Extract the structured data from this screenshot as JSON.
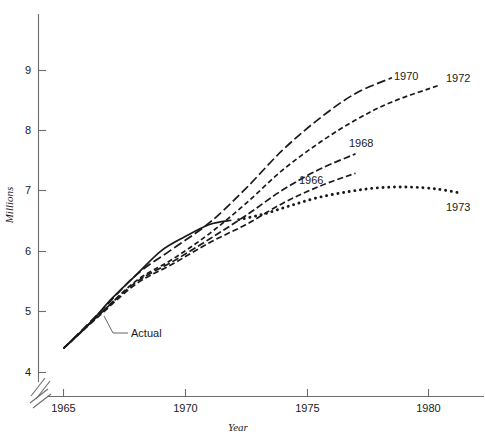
{
  "chart_data": {
    "type": "line",
    "title": "",
    "xlabel": "Year",
    "ylabel": "Millions",
    "xlim": [
      1964.2,
      1981.6
    ],
    "ylim": [
      3.85,
      9.55
    ],
    "grid": false,
    "legend_position": "inline-right-of-curve-ends",
    "axis_break": {
      "x": true,
      "y": true,
      "note": "double slash break near origin on both axes"
    },
    "xticks": [
      1965,
      1970,
      1975,
      1980
    ],
    "xtick_labels": [
      "1965",
      "1970",
      "1975",
      "1980"
    ],
    "yticks": [
      4,
      5,
      6,
      7,
      8,
      9
    ],
    "ytick_labels": [
      "4",
      "5",
      "6",
      "7",
      "8",
      "9"
    ],
    "series": [
      {
        "name": "Actual",
        "label": "Actual",
        "style": "solid",
        "x": [
          1965.0,
          1966.0,
          1967.0,
          1968.0,
          1969.0,
          1970.0,
          1971.0,
          1971.9
        ],
        "y": [
          4.4,
          4.78,
          5.23,
          5.62,
          6.01,
          6.25,
          6.45,
          6.52
        ]
      },
      {
        "name": "1966",
        "label": "1966",
        "style": "dashed",
        "x": [
          1965.0,
          1966.5,
          1968.0,
          1969.5,
          1971.0,
          1972.5,
          1974.0,
          1975.5,
          1977.0
        ],
        "y": [
          4.4,
          4.95,
          5.47,
          5.8,
          6.15,
          6.45,
          6.8,
          7.08,
          7.3
        ]
      },
      {
        "name": "1968",
        "label": "1968",
        "style": "dashed",
        "x": [
          1965.0,
          1966.5,
          1968.0,
          1969.5,
          1971.0,
          1972.5,
          1974.0,
          1975.5,
          1977.0
        ],
        "y": [
          4.4,
          4.97,
          5.5,
          5.84,
          6.21,
          6.6,
          7.02,
          7.36,
          7.62
        ]
      },
      {
        "name": "1970",
        "label": "1970",
        "style": "dashed",
        "x": [
          1965.0,
          1966.5,
          1968.0,
          1969.5,
          1971.0,
          1972.5,
          1974.0,
          1975.5,
          1977.0,
          1978.5
        ],
        "y": [
          4.4,
          5.0,
          5.62,
          6.05,
          6.48,
          7.05,
          7.68,
          8.2,
          8.62,
          8.88
        ]
      },
      {
        "name": "1972",
        "label": "1972",
        "style": "dashed",
        "x": [
          1965.0,
          1966.5,
          1968.0,
          1969.5,
          1971.0,
          1972.5,
          1974.0,
          1975.5,
          1977.0,
          1978.5,
          1980.4
        ],
        "y": [
          4.4,
          4.97,
          5.52,
          5.88,
          6.3,
          6.8,
          7.35,
          7.8,
          8.18,
          8.48,
          8.75
        ]
      },
      {
        "name": "1973",
        "label": "1973",
        "style": "dotted",
        "x": [
          1972.2,
          1973.2,
          1974.3,
          1975.5,
          1976.8,
          1978.0,
          1979.2,
          1980.3,
          1981.2
        ],
        "y": [
          6.53,
          6.62,
          6.76,
          6.9,
          7.0,
          7.06,
          7.07,
          7.04,
          6.98
        ]
      }
    ],
    "annotations": [
      {
        "text": "Actual",
        "x": 1967.8,
        "y": 4.78,
        "kind": "leader-label"
      },
      {
        "text": "1966",
        "x": 1977.3,
        "y": 7.3,
        "kind": "end-label"
      },
      {
        "text": "1968",
        "x": 1977.3,
        "y": 7.62,
        "kind": "end-label"
      },
      {
        "text": "1970",
        "x": 1978.8,
        "y": 8.88,
        "kind": "end-label"
      },
      {
        "text": "1972",
        "x": 1980.7,
        "y": 8.82,
        "kind": "end-label"
      },
      {
        "text": "1973",
        "x": 1981.4,
        "y": 6.8,
        "kind": "end-label"
      }
    ]
  },
  "axes": {
    "y_title": "Millions",
    "x_title": "Year",
    "xtick_1965": "1965",
    "xtick_1970": "1970",
    "xtick_1975": "1975",
    "xtick_1980": "1980",
    "ytick_4": "4",
    "ytick_5": "5",
    "ytick_6": "6",
    "ytick_7": "7",
    "ytick_8": "8",
    "ytick_9": "9"
  },
  "labels": {
    "actual": "Actual",
    "y1966": "1966",
    "y1968": "1968",
    "y1970": "1970",
    "y1972": "1972",
    "y1973": "1973"
  },
  "colors": {
    "ink": "#1a1a1a",
    "axis": "#6d6d6d",
    "background": "#ffffff"
  }
}
